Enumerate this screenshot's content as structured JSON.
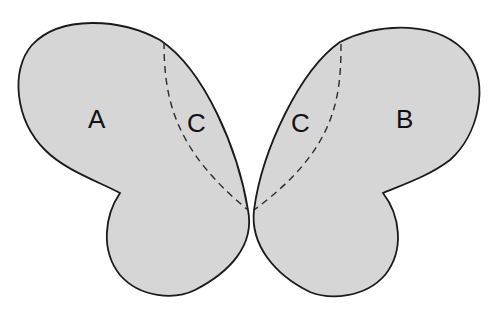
{
  "diagram": {
    "colors": {
      "fill": "#d6d6d6",
      "outline": "#1a1a1a",
      "background": "#ffffff"
    },
    "left_wing": {
      "outer_label": "A",
      "inner_label": "C"
    },
    "right_wing": {
      "outer_label": "B",
      "inner_label": "C"
    }
  }
}
